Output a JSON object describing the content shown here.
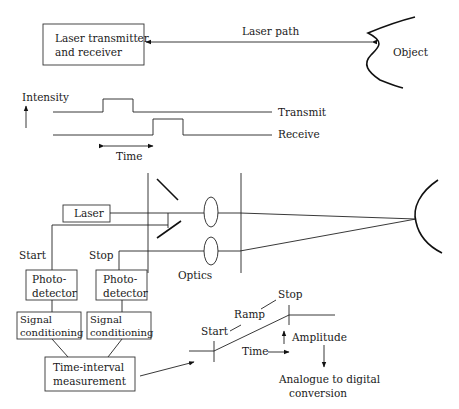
{
  "top": {
    "transceiver_line1": "Laser transmitter",
    "transceiver_line2": "and receiver",
    "path_label": "Laser path",
    "object_label": "Object"
  },
  "timing": {
    "intensity_label": "Intensity",
    "transmit_label": "Transmit",
    "receive_label": "Receive",
    "time_label": "Time"
  },
  "optics": {
    "laser_label": "Laser",
    "start_label": "Start",
    "stop_label": "Stop",
    "optics_label": "Optics"
  },
  "electronics": {
    "photodetector_line1": "Photo-",
    "photodetector_line2": "detector",
    "signal_line1": "Signal",
    "signal_line2": "conditioning",
    "tim_line1": "Time-interval",
    "tim_line2": "measurement"
  },
  "ramp": {
    "start_label": "Start",
    "ramp_label": "Ramp",
    "stop_label": "Stop",
    "time_label": "Time",
    "amplitude_label": "Amplitude",
    "adc_line1": "Analogue to digital",
    "adc_line2": "conversion"
  },
  "colors": {
    "ink": "#222222",
    "background": "#ffffff"
  }
}
